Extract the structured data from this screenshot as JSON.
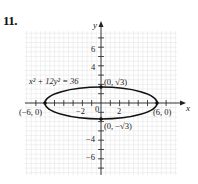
{
  "problem": {
    "number": "11."
  },
  "chart_data": {
    "type": "line",
    "title": "",
    "equation": "x² + 12y² = 36",
    "xlabel": "x",
    "ylabel": "y",
    "xlim": [
      -8,
      8
    ],
    "ylim": [
      -8,
      8
    ],
    "grid": true,
    "x_tick_labels": [
      "−2",
      "2"
    ],
    "y_tick_labels": [
      "6",
      "4",
      "−4",
      "−6"
    ],
    "origin_label": "0",
    "curve": {
      "shape": "ellipse",
      "center": [
        0,
        0
      ],
      "semi_major_x": 6,
      "semi_minor_y": 1.732
    },
    "points": [
      {
        "label": "(−6, 0)",
        "x": -6,
        "y": 0
      },
      {
        "label": "(6, 0)",
        "x": 6,
        "y": 0
      },
      {
        "label": "(0, √3)",
        "x": 0,
        "y": 1.732
      },
      {
        "label": "(0, −√3)",
        "x": 0,
        "y": -1.732
      }
    ]
  }
}
